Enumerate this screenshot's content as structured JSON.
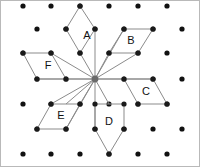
{
  "figure": {
    "width": 200,
    "height": 167,
    "background_color": "#ffffff",
    "border_color": "#b9b9b9",
    "dot_color": "#111111",
    "line_color": "#8b8b8b",
    "label_color": "#111111",
    "hub_color": "#6a6a6a",
    "hub": {
      "x": 94,
      "y": 78
    },
    "lattice": {
      "type": "triangular",
      "x_spacing": 29,
      "y_spacing": 25,
      "row_offset": 14,
      "rows": [
        {
          "y": 5,
          "xs": [
            22,
            50,
            79,
            108,
            137,
            166
          ]
        },
        {
          "y": 28,
          "xs": [
            36,
            65,
            94,
            123,
            152,
            181
          ]
        },
        {
          "y": 52,
          "xs": [
            22,
            50,
            79,
            108,
            137,
            166
          ]
        },
        {
          "y": 78,
          "xs": [
            36,
            65,
            94,
            123,
            152,
            181
          ]
        },
        {
          "y": 103,
          "xs": [
            22,
            50,
            79,
            108,
            137,
            166
          ]
        },
        {
          "y": 128,
          "xs": [
            36,
            65,
            94,
            123,
            152,
            181
          ]
        },
        {
          "y": 153,
          "xs": [
            22,
            50,
            79,
            108,
            137,
            166
          ]
        }
      ]
    },
    "spokes": [
      {
        "name": "spoke-to-a-inner",
        "x1": 94,
        "y1": 78,
        "x2": 94,
        "y2": 28
      },
      {
        "name": "spoke-to-a-lower",
        "x1": 94,
        "y1": 78,
        "x2": 79,
        "y2": 52
      },
      {
        "name": "spoke-to-b-inner",
        "x1": 94,
        "y1": 78,
        "x2": 123,
        "y2": 28
      },
      {
        "name": "spoke-to-b-lower",
        "x1": 94,
        "y1": 78,
        "x2": 108,
        "y2": 52
      },
      {
        "name": "spoke-to-b-mid",
        "x1": 94,
        "y1": 78,
        "x2": 137,
        "y2": 52
      },
      {
        "name": "spoke-to-c-right",
        "x1": 94,
        "y1": 78,
        "x2": 152,
        "y2": 78
      },
      {
        "name": "spoke-to-c-inner",
        "x1": 94,
        "y1": 78,
        "x2": 123,
        "y2": 78
      },
      {
        "name": "spoke-to-d-inner",
        "x1": 94,
        "y1": 78,
        "x2": 94,
        "y2": 128
      },
      {
        "name": "spoke-to-d-lower",
        "x1": 94,
        "y1": 78,
        "x2": 108,
        "y2": 103
      },
      {
        "name": "spoke-to-d-mid",
        "x1": 94,
        "y1": 78,
        "x2": 79,
        "y2": 103
      },
      {
        "name": "spoke-to-e-inner",
        "x1": 94,
        "y1": 78,
        "x2": 65,
        "y2": 128
      },
      {
        "name": "spoke-to-e-upper",
        "x1": 94,
        "y1": 78,
        "x2": 65,
        "y2": 103
      },
      {
        "name": "spoke-to-e-side",
        "x1": 94,
        "y1": 78,
        "x2": 50,
        "y2": 103
      },
      {
        "name": "spoke-to-f-left",
        "x1": 94,
        "y1": 78,
        "x2": 36,
        "y2": 78
      },
      {
        "name": "spoke-to-f-inner",
        "x1": 94,
        "y1": 78,
        "x2": 65,
        "y2": 78
      },
      {
        "name": "spoke-to-f-upper",
        "x1": 94,
        "y1": 78,
        "x2": 50,
        "y2": 52
      }
    ],
    "shapes": [
      {
        "id": "shape-a",
        "label": "A",
        "label_x": 86,
        "label_y": 35,
        "points": "79,5 65,28 79,52 94,28",
        "vertices": [
          {
            "x": 79,
            "y": 5
          },
          {
            "x": 65,
            "y": 28
          },
          {
            "x": 79,
            "y": 52
          },
          {
            "x": 94,
            "y": 28
          }
        ]
      },
      {
        "id": "shape-b",
        "label": "B",
        "label_x": 130,
        "label_y": 40,
        "points": "123,28 152,28 137,52 108,52",
        "vertices": [
          {
            "x": 123,
            "y": 28
          },
          {
            "x": 152,
            "y": 28
          },
          {
            "x": 137,
            "y": 52
          },
          {
            "x": 108,
            "y": 52
          }
        ]
      },
      {
        "id": "shape-c",
        "label": "C",
        "label_x": 145,
        "label_y": 91,
        "points": "123,78 152,78 166,103 137,103",
        "vertices": [
          {
            "x": 123,
            "y": 78
          },
          {
            "x": 152,
            "y": 78
          },
          {
            "x": 166,
            "y": 103
          },
          {
            "x": 137,
            "y": 103
          }
        ]
      },
      {
        "id": "shape-d",
        "label": "D",
        "label_x": 108,
        "label_y": 121,
        "points": "94,103 94,128 108,153 123,128 123,103",
        "vertices": [
          {
            "x": 94,
            "y": 103
          },
          {
            "x": 94,
            "y": 128
          },
          {
            "x": 108,
            "y": 153
          },
          {
            "x": 123,
            "y": 128
          },
          {
            "x": 123,
            "y": 103
          }
        ]
      },
      {
        "id": "shape-e",
        "label": "E",
        "label_x": 60,
        "label_y": 115,
        "points": "50,103 36,128 65,128 79,103",
        "vertices": [
          {
            "x": 50,
            "y": 103
          },
          {
            "x": 36,
            "y": 128
          },
          {
            "x": 65,
            "y": 128
          },
          {
            "x": 79,
            "y": 103
          }
        ]
      },
      {
        "id": "shape-f",
        "label": "F",
        "label_x": 47,
        "label_y": 65,
        "points": "22,52 50,52 65,78 36,78",
        "vertices": [
          {
            "x": 22,
            "y": 52
          },
          {
            "x": 50,
            "y": 52
          },
          {
            "x": 65,
            "y": 78
          },
          {
            "x": 36,
            "y": 78
          }
        ]
      }
    ]
  }
}
